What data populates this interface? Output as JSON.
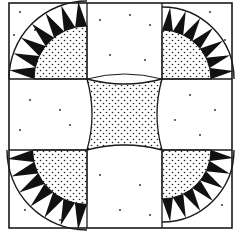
{
  "figure": {
    "colors": {
      "background": "#ffffff",
      "line": "#1a1a1a",
      "triangle_fill": "#111111",
      "stipple": "#222222"
    },
    "layout": {
      "outer": [
        9,
        3,
        232,
        228
      ],
      "col_lines": [
        87,
        162
      ],
      "row_lines": [
        79,
        150
      ]
    },
    "corners": [
      {
        "name": "top-left",
        "triangles": 7
      },
      {
        "name": "top-right",
        "triangles": 7
      },
      {
        "name": "bottom-left",
        "triangles": 7
      },
      {
        "name": "bottom-right",
        "triangles": 7
      }
    ],
    "center": {
      "shape": "concave square",
      "fill": "stippled"
    }
  }
}
